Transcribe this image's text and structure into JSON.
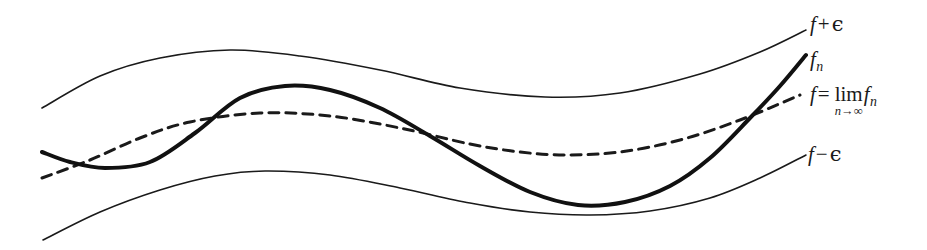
{
  "figure": {
    "background_color": "#ffffff",
    "ink_color": "#1a1a1a",
    "width": 927,
    "height": 250
  },
  "labels": {
    "upper_envelope": {
      "f": "f",
      "operator": "+",
      "epsilon": "ϵ"
    },
    "fn": {
      "f": "f",
      "subscript": "n"
    },
    "limit": {
      "f": "f",
      "equals": "=",
      "lim": "lim",
      "under_n": "n",
      "under_arrow": "→",
      "under_infinity": "∞",
      "limit_of_f": "f",
      "limit_of_subscript": "n"
    },
    "lower_envelope": {
      "f": "f",
      "operator": "−",
      "epsilon": "ϵ"
    }
  },
  "chart_data": {
    "type": "line",
    "xlabel": "",
    "ylabel": "",
    "grid": false,
    "legend_position": "right-inline",
    "axis_visible": false,
    "xlim": [
      42,
      806
    ],
    "ylim": [
      250,
      0
    ],
    "series": [
      {
        "name": "f + ϵ",
        "style": "solid",
        "width": 1.6,
        "color": "#1a1a1a",
        "description": "Upper envelope: rises from left, crests near x=230, dips to a minimum near x=545, then rises steeply to the right end",
        "points": [
          [
            42,
            108
          ],
          [
            100,
            76
          ],
          [
            160,
            58
          ],
          [
            230,
            50
          ],
          [
            300,
            56
          ],
          [
            380,
            70
          ],
          [
            460,
            88
          ],
          [
            545,
            97
          ],
          [
            620,
            93
          ],
          [
            700,
            74
          ],
          [
            760,
            52
          ],
          [
            806,
            30
          ]
        ]
      },
      {
        "name": "f_n",
        "style": "solid",
        "width": 4.0,
        "color": "#111111",
        "description": "Approximating function: starts at left, dips to a small trough near x=110, rises to a crest near x=285, falls to a deep minimum near x=578, then climbs steeply crossing f near x=755 to the right end",
        "points": [
          [
            42,
            152
          ],
          [
            70,
            162
          ],
          [
            105,
            168
          ],
          [
            150,
            162
          ],
          [
            195,
            133
          ],
          [
            240,
            98
          ],
          [
            285,
            86
          ],
          [
            330,
            90
          ],
          [
            380,
            108
          ],
          [
            430,
            136
          ],
          [
            480,
            166
          ],
          [
            530,
            192
          ],
          [
            578,
            205
          ],
          [
            625,
            202
          ],
          [
            670,
            186
          ],
          [
            710,
            158
          ],
          [
            750,
            118
          ],
          [
            780,
            86
          ],
          [
            806,
            55
          ]
        ]
      },
      {
        "name": "f = lim_{n→∞} f_n",
        "style": "dashed",
        "width": 3.0,
        "color": "#1a1a1a",
        "dash_pattern": [
          10,
          7
        ],
        "description": "Limit function: gently rises from left, broad flat maximum near x=260, shallow minimum near x=565, then rises to the right end",
        "points": [
          [
            42,
            178
          ],
          [
            90,
            160
          ],
          [
            140,
            138
          ],
          [
            190,
            122
          ],
          [
            260,
            113
          ],
          [
            330,
            116
          ],
          [
            400,
            128
          ],
          [
            470,
            144
          ],
          [
            520,
            152
          ],
          [
            565,
            155
          ],
          [
            620,
            152
          ],
          [
            680,
            140
          ],
          [
            740,
            120
          ],
          [
            800,
            95
          ]
        ]
      },
      {
        "name": "f − ϵ",
        "style": "solid",
        "width": 1.6,
        "color": "#1a1a1a",
        "description": "Lower envelope: rises from the lower left, crests near x=265, dips to a minimum near x=590, then rises to the right end",
        "points": [
          [
            43,
            240
          ],
          [
            100,
            212
          ],
          [
            160,
            190
          ],
          [
            215,
            176
          ],
          [
            265,
            171
          ],
          [
            330,
            175
          ],
          [
            400,
            188
          ],
          [
            470,
            203
          ],
          [
            530,
            212
          ],
          [
            590,
            215
          ],
          [
            650,
            211
          ],
          [
            710,
            198
          ],
          [
            760,
            178
          ],
          [
            806,
            155
          ]
        ]
      }
    ],
    "annotations": [
      {
        "text": "f + ϵ",
        "x": 810,
        "y": 25,
        "anchor": "left"
      },
      {
        "text": "f_n",
        "x": 810,
        "y": 60,
        "anchor": "left"
      },
      {
        "text": "f = lim_{n→∞} f_n",
        "x": 810,
        "y": 95,
        "anchor": "left"
      },
      {
        "text": "f − ϵ",
        "x": 808,
        "y": 155,
        "anchor": "left"
      }
    ]
  }
}
